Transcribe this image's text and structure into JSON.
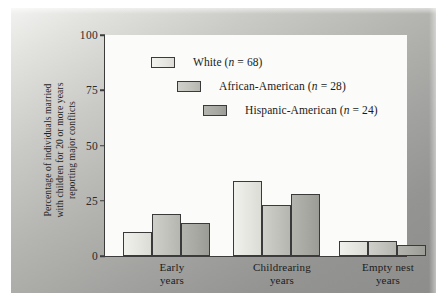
{
  "chart_data": {
    "type": "bar",
    "title": "",
    "subtitle": "",
    "xlabel": "",
    "ylabel": "Percentage of individuals married with children for 20 or more years reporting major conflicts",
    "ylabel_lines": [
      "Percentage of individuals married",
      "with children for 20 or more years",
      "reporting major conflicts"
    ],
    "categories": [
      "Early years",
      "Childrearing years",
      "Empty nest years"
    ],
    "category_lines": [
      [
        "Early",
        "years"
      ],
      [
        "Childrearing",
        "years"
      ],
      [
        "Empty nest",
        "years"
      ]
    ],
    "series": [
      {
        "name": "White (n = 68)",
        "label_text": "White",
        "n": 68,
        "values": [
          11,
          34,
          7
        ],
        "color": "#e7e7e2"
      },
      {
        "name": "African-American (n = 28)",
        "label_text": "African-American",
        "n": 28,
        "values": [
          19,
          23,
          7
        ],
        "color": "#c3c3be"
      },
      {
        "name": "Hispanic-American (n = 24)",
        "label_text": "Hispanic-American",
        "n": 24,
        "values": [
          15,
          28,
          5
        ],
        "color": "#a9a9a3"
      }
    ],
    "ylim": [
      0,
      100
    ],
    "yticks": [
      0,
      25,
      50,
      75,
      100
    ],
    "ytick_labels": [
      "0",
      "25",
      "50",
      "75",
      "100"
    ],
    "grid": false,
    "legend_position": "inside-upper-center",
    "axis_color": "#3c3c3c",
    "plot_background": "#fbfbf9",
    "panel_background": "#b4b4b0"
  },
  "legend": {
    "rows": [
      {
        "label": "White (n = 68)",
        "prefix": "White (",
        "italic": "n",
        "suffix": " = 68)"
      },
      {
        "label": "African-American (n = 28)",
        "prefix": "African-American (",
        "italic": "n",
        "suffix": " = 28)"
      },
      {
        "label": "Hispanic-American (n = 24)",
        "prefix": "Hispanic-American (",
        "italic": "n",
        "suffix": " = 24)"
      }
    ]
  }
}
